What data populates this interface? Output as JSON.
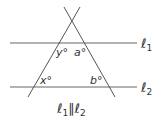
{
  "diagram": {
    "lines": {
      "l1": {
        "label": "ℓ",
        "sub": "1"
      },
      "l2": {
        "label": "ℓ",
        "sub": "2"
      }
    },
    "angles": {
      "y": "y°",
      "a": "a°",
      "x": "x°",
      "b": "b°"
    },
    "caption": {
      "left": "ℓ",
      "left_sub": "1",
      "mid": "∥",
      "right": "ℓ",
      "right_sub": "2"
    },
    "colors": {
      "stroke": "#555555",
      "text": "#333333"
    }
  }
}
